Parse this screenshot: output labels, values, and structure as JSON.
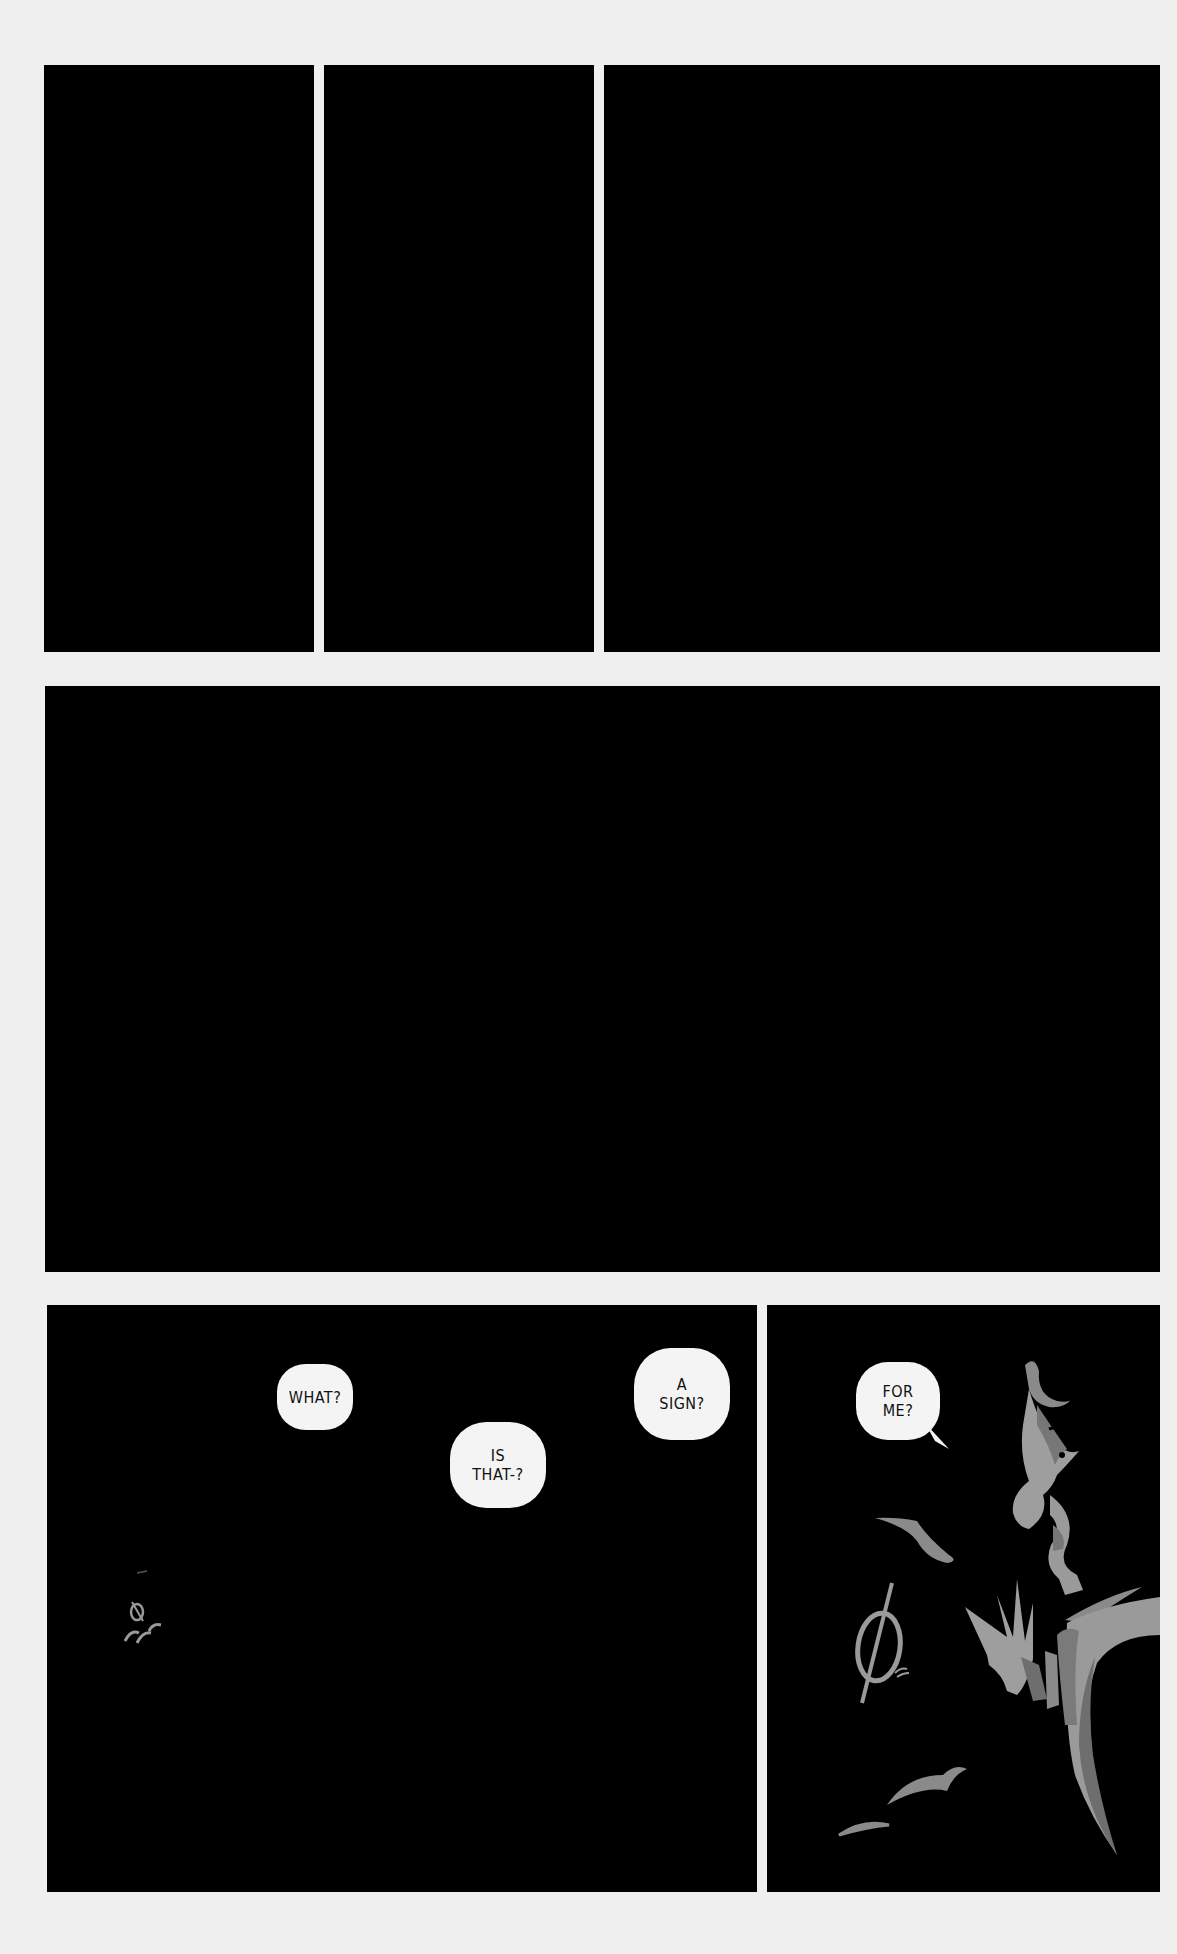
{
  "page": {
    "background": "#efefef",
    "panel_color": "#000000",
    "figure_color": "#9a9a9a",
    "figure_shadow": "#6e6e6e"
  },
  "panels": [
    {
      "id": "A",
      "row": 1,
      "content": "black"
    },
    {
      "id": "B",
      "row": 1,
      "content": "black"
    },
    {
      "id": "C",
      "row": 1,
      "content": "black"
    },
    {
      "id": "D",
      "row": 2,
      "content": "black"
    },
    {
      "id": "F",
      "row": 3,
      "content": "speech bubbles and distant glowing symbol"
    },
    {
      "id": "G",
      "row": 3,
      "content": "figure reaching toward glowing symbol"
    }
  ],
  "bubbles": {
    "what": "WHAT?",
    "is_that": "IS\nTHAT-?",
    "a_sign": "A\nSIGN?",
    "for_me": "FOR\nME?"
  },
  "symbols": {
    "glyph": "∅"
  }
}
